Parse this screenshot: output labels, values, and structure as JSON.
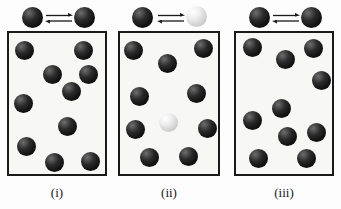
{
  "figure": {
    "width": 341,
    "height": 209,
    "background_color": "#fdfdfd",
    "box_fill_color": "#f7f7f5",
    "box_border_color": "#1a1a1a",
    "dark_sphere_color": "#141414",
    "light_sphere_color": "#d9d9d9",
    "arrow_color": "#1a1a1a",
    "arrow_symbol": "equilibrium-double-arrow"
  },
  "panels": [
    {
      "id": "panel-i",
      "caption": "(i)",
      "box": {
        "x": 7,
        "y": 31,
        "width": 100,
        "height": 145
      },
      "header": {
        "left_sphere": {
          "type": "dark",
          "x": 22,
          "y": 7
        },
        "right_sphere": {
          "type": "dark",
          "x": 74,
          "y": 7
        },
        "arrows": {
          "x": 45,
          "y": 13,
          "width": 28
        }
      },
      "dark_count": 10,
      "light_count": 0,
      "spheres": [
        {
          "type": "dark",
          "cx": 24,
          "cy": 50,
          "r": 9.5
        },
        {
          "type": "dark",
          "cx": 83,
          "cy": 50,
          "r": 9.5
        },
        {
          "type": "dark",
          "cx": 52,
          "cy": 74,
          "r": 9.5
        },
        {
          "type": "dark",
          "cx": 88,
          "cy": 74,
          "r": 9.5
        },
        {
          "type": "dark",
          "cx": 71,
          "cy": 91,
          "r": 9.5
        },
        {
          "type": "dark",
          "cx": 23,
          "cy": 103,
          "r": 9.5
        },
        {
          "type": "dark",
          "cx": 67,
          "cy": 126,
          "r": 9.5
        },
        {
          "type": "dark",
          "cx": 26,
          "cy": 146,
          "r": 9.5
        },
        {
          "type": "dark",
          "cx": 54,
          "cy": 162,
          "r": 9.5
        },
        {
          "type": "dark",
          "cx": 90,
          "cy": 161,
          "r": 9.5
        }
      ],
      "caption_box": {
        "x": 7,
        "y": 185,
        "width": 100
      }
    },
    {
      "id": "panel-ii",
      "caption": "(ii)",
      "box": {
        "x": 118,
        "y": 31,
        "width": 102,
        "height": 145
      },
      "header": {
        "left_sphere": {
          "type": "dark",
          "x": 132,
          "y": 7
        },
        "right_sphere": {
          "type": "light",
          "x": 186,
          "y": 6
        },
        "arrows": {
          "x": 157,
          "y": 13,
          "width": 28
        }
      },
      "dark_count": 9,
      "light_count": 1,
      "spheres": [
        {
          "type": "dark",
          "cx": 133,
          "cy": 50,
          "r": 9.5
        },
        {
          "type": "dark",
          "cx": 203,
          "cy": 48,
          "r": 9.5
        },
        {
          "type": "dark",
          "cx": 167,
          "cy": 63,
          "r": 9.5
        },
        {
          "type": "dark",
          "cx": 139,
          "cy": 96,
          "r": 9.5
        },
        {
          "type": "dark",
          "cx": 196,
          "cy": 93,
          "r": 9.5
        },
        {
          "type": "light",
          "cx": 168,
          "cy": 122,
          "r": 9.5
        },
        {
          "type": "dark",
          "cx": 135,
          "cy": 129,
          "r": 9.5
        },
        {
          "type": "dark",
          "cx": 207,
          "cy": 128,
          "r": 9.5
        },
        {
          "type": "dark",
          "cx": 149,
          "cy": 157,
          "r": 9.5
        },
        {
          "type": "dark",
          "cx": 188,
          "cy": 156,
          "r": 9.5
        }
      ],
      "caption_box": {
        "x": 118,
        "y": 185,
        "width": 102
      }
    },
    {
      "id": "panel-iii",
      "caption": "(iii)",
      "box": {
        "x": 234,
        "y": 31,
        "width": 100,
        "height": 145
      },
      "header": {
        "left_sphere": {
          "type": "dark",
          "x": 249,
          "y": 7
        },
        "right_sphere": {
          "type": "dark",
          "x": 301,
          "y": 7
        },
        "arrows": {
          "x": 272,
          "y": 13,
          "width": 28
        }
      },
      "dark_count": 10,
      "light_count": 0,
      "spheres": [
        {
          "type": "dark",
          "cx": 252,
          "cy": 47,
          "r": 9.5
        },
        {
          "type": "dark",
          "cx": 285,
          "cy": 59,
          "r": 9.5
        },
        {
          "type": "dark",
          "cx": 313,
          "cy": 48,
          "r": 9.5
        },
        {
          "type": "dark",
          "cx": 321,
          "cy": 80,
          "r": 9.5
        },
        {
          "type": "dark",
          "cx": 281,
          "cy": 108,
          "r": 9.5
        },
        {
          "type": "dark",
          "cx": 252,
          "cy": 120,
          "r": 9.5
        },
        {
          "type": "dark",
          "cx": 287,
          "cy": 136,
          "r": 9.5
        },
        {
          "type": "dark",
          "cx": 316,
          "cy": 132,
          "r": 9.5
        },
        {
          "type": "dark",
          "cx": 258,
          "cy": 158,
          "r": 9.5
        },
        {
          "type": "dark",
          "cx": 306,
          "cy": 158,
          "r": 9.5
        }
      ],
      "caption_box": {
        "x": 234,
        "y": 185,
        "width": 100
      }
    }
  ]
}
